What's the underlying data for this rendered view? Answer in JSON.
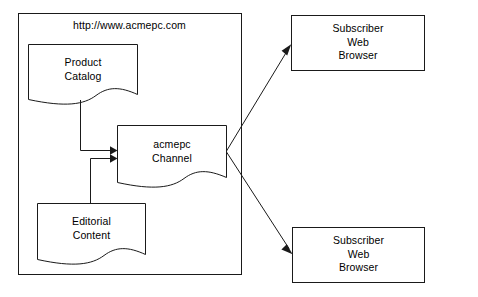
{
  "diagram": {
    "type": "block-flow-diagram",
    "site_container": {
      "label": "http://www.acmepc.com",
      "name": "site-container"
    },
    "nodes": [
      {
        "id": "product-catalog",
        "shape": "document",
        "lines": [
          "Product",
          "Catalog"
        ],
        "text": "Product\nCatalog"
      },
      {
        "id": "acmepc-channel",
        "shape": "document",
        "lines": [
          "acmepc",
          "Channel"
        ],
        "text": "acmepc\nChannel"
      },
      {
        "id": "editorial-content",
        "shape": "document",
        "lines": [
          "Editorial",
          "Content"
        ],
        "text": "Editorial\nContent"
      },
      {
        "id": "subscriber-web-browser-top",
        "shape": "rectangle",
        "lines": [
          "Subscriber",
          "Web",
          "Browser"
        ],
        "text": "Subscriber\nWeb\nBrowser"
      },
      {
        "id": "subscriber-web-browser-bottom",
        "shape": "rectangle",
        "lines": [
          "Subscriber",
          "Web",
          "Browser"
        ],
        "text": "Subscriber\nWeb\nBrowser"
      }
    ],
    "edges": [
      {
        "id": "catalog-to-channel",
        "from": "product-catalog",
        "to": "acmepc-channel",
        "arrow": true
      },
      {
        "id": "editorial-to-channel",
        "from": "editorial-content",
        "to": "acmepc-channel",
        "arrow": true
      },
      {
        "id": "channel-to-subscriber-top",
        "from": "acmepc-channel",
        "to": "subscriber-web-browser-top",
        "arrow": true
      },
      {
        "id": "channel-to-subscriber-bottom",
        "from": "acmepc-channel",
        "to": "subscriber-web-browser-bottom",
        "arrow": true
      }
    ],
    "colors": {
      "stroke": "#1a1a1a",
      "fill": "#ffffff",
      "text": "#000000",
      "background": "#ffffff"
    }
  }
}
